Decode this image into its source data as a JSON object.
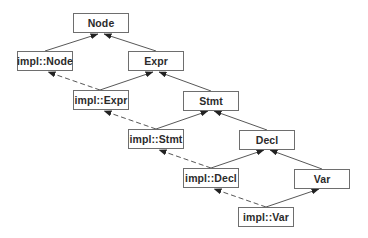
{
  "diagram": {
    "title": "",
    "colors": {
      "box_border": "#6e6e6e",
      "text": "#2b2b2b",
      "edge": "#444444",
      "background": "#ffffff"
    },
    "nodes": [
      {
        "id": "node",
        "label": "Node",
        "x": 73,
        "y": 13,
        "w": 56,
        "h": 20
      },
      {
        "id": "impl_node",
        "label": "impl::Node",
        "x": 17,
        "y": 51,
        "w": 56,
        "h": 20
      },
      {
        "id": "expr",
        "label": "Expr",
        "x": 128,
        "y": 51,
        "w": 56,
        "h": 20
      },
      {
        "id": "impl_expr",
        "label": "impl::Expr",
        "x": 73,
        "y": 90,
        "w": 56,
        "h": 20
      },
      {
        "id": "stmt",
        "label": "Stmt",
        "x": 183,
        "y": 91,
        "w": 56,
        "h": 20
      },
      {
        "id": "impl_stmt",
        "label": "impl::Stmt",
        "x": 128,
        "y": 129,
        "w": 56,
        "h": 20
      },
      {
        "id": "decl",
        "label": "Decl",
        "x": 239,
        "y": 130,
        "w": 56,
        "h": 20
      },
      {
        "id": "impl_decl",
        "label": "impl::Decl",
        "x": 183,
        "y": 168,
        "w": 56,
        "h": 20
      },
      {
        "id": "var",
        "label": "Var",
        "x": 294,
        "y": 169,
        "w": 56,
        "h": 20
      },
      {
        "id": "impl_var",
        "label": "impl::Var",
        "x": 238,
        "y": 207,
        "w": 56,
        "h": 20
      }
    ],
    "edges": [
      {
        "from": "impl_node",
        "to": "node",
        "style": "solid",
        "x1": 45,
        "y1": 51,
        "x2": 98,
        "y2": 34
      },
      {
        "from": "expr",
        "to": "node",
        "style": "solid",
        "x1": 156,
        "y1": 51,
        "x2": 104,
        "y2": 34
      },
      {
        "from": "impl_expr",
        "to": "expr",
        "style": "solid",
        "x1": 100,
        "y1": 90,
        "x2": 153,
        "y2": 72
      },
      {
        "from": "impl_expr",
        "to": "impl_node",
        "style": "dashed",
        "x1": 100,
        "y1": 90,
        "x2": 48,
        "y2": 72
      },
      {
        "from": "stmt",
        "to": "expr",
        "style": "solid",
        "x1": 211,
        "y1": 91,
        "x2": 159,
        "y2": 72
      },
      {
        "from": "impl_stmt",
        "to": "stmt",
        "style": "solid",
        "x1": 156,
        "y1": 129,
        "x2": 208,
        "y2": 111
      },
      {
        "from": "impl_stmt",
        "to": "impl_expr",
        "style": "dashed",
        "x1": 156,
        "y1": 129,
        "x2": 104,
        "y2": 111
      },
      {
        "from": "decl",
        "to": "stmt",
        "style": "solid",
        "x1": 267,
        "y1": 130,
        "x2": 214,
        "y2": 111
      },
      {
        "from": "impl_decl",
        "to": "decl",
        "style": "solid",
        "x1": 211,
        "y1": 168,
        "x2": 264,
        "y2": 150
      },
      {
        "from": "impl_decl",
        "to": "impl_stmt",
        "style": "dashed",
        "x1": 211,
        "y1": 168,
        "x2": 159,
        "y2": 150
      },
      {
        "from": "var",
        "to": "decl",
        "style": "solid",
        "x1": 322,
        "y1": 169,
        "x2": 270,
        "y2": 150
      },
      {
        "from": "impl_var",
        "to": "var",
        "style": "solid",
        "x1": 266,
        "y1": 207,
        "x2": 319,
        "y2": 189
      },
      {
        "from": "impl_var",
        "to": "impl_decl",
        "style": "dashed",
        "x1": 266,
        "y1": 207,
        "x2": 214,
        "y2": 189
      }
    ]
  }
}
